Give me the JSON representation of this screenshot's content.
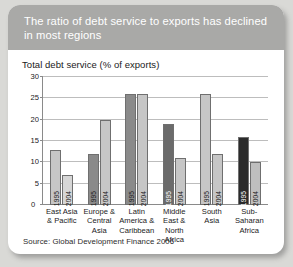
{
  "header": {
    "title": "The ratio of debt service to exports has declined in most regions"
  },
  "axis_title": "Total debt service (% of exports)",
  "source": "Source: Global Development Finance 2006",
  "zero_label": "0",
  "chart_data": {
    "type": "bar",
    "title": "The ratio of debt service to exports has declined in most regions",
    "subtitle": "Total debt service (% of exports)",
    "xlabel": "",
    "ylabel": "Total debt service (% of exports)",
    "ylim": [
      0,
      30
    ],
    "yticks": [
      0,
      5,
      10,
      15,
      20,
      25,
      30
    ],
    "ytick_labels": [
      "0",
      "5",
      "10",
      "15",
      "20",
      "25",
      "30"
    ],
    "grid": true,
    "legend": "none",
    "bar_labels_inside": true,
    "categories": [
      "East Asia & Pacific",
      "Europe & Central Asia",
      "Latin America & Caribbean",
      "Middle East & North Africa",
      "South Asia",
      "Sub-Saharan Africa"
    ],
    "series": [
      {
        "name": "1995",
        "values": [
          13,
          12,
          26,
          19,
          26,
          16
        ],
        "colors": [
          "#c6c6c6",
          "#8a8a8a",
          "#8a8a8a",
          "#6b6b6b",
          "#c6c6c6",
          "#2b2b2b"
        ]
      },
      {
        "name": "2004",
        "values": [
          7,
          20,
          26,
          11,
          12,
          10
        ],
        "colors": [
          "#d6d6d6",
          "#c6c6c6",
          "#c6c6c6",
          "#c6c6c6",
          "#c6c6c6",
          "#bfbfbf"
        ]
      }
    ]
  },
  "colors": {
    "header_band": "#a9a9a7",
    "card": "#ffffff",
    "page_background": "#d9d9d6",
    "gridline": "#bdbdbd",
    "axis": "#8a8a8a"
  }
}
